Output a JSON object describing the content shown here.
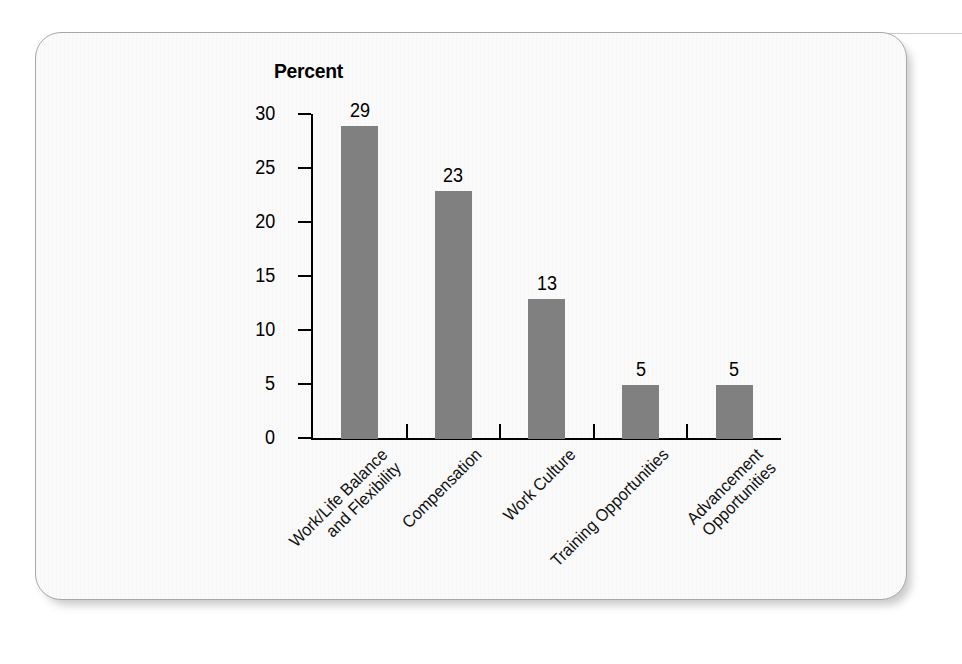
{
  "card": {
    "background_color": "#fafafa",
    "border_color": "#a8a8a8"
  },
  "chart_data": {
    "type": "bar",
    "title": "Percent",
    "xlabel": "",
    "ylabel": "Percent",
    "ylim": [
      0,
      30
    ],
    "yticks": [
      0,
      5,
      10,
      15,
      20,
      25,
      30
    ],
    "grid": false,
    "legend": "none",
    "bar_color": "#808080",
    "categories": [
      "Work/Life Balance\nand Flexibility",
      "Compensation",
      "Work Culture",
      "Training Opportunities",
      "Advancement\nOpportunities"
    ],
    "values": [
      29,
      23,
      13,
      5,
      5
    ],
    "value_labels": [
      "29",
      "23",
      "13",
      "5",
      "5"
    ]
  }
}
